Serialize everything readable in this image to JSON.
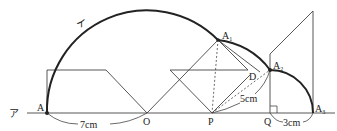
{
  "diagram": {
    "labels": {
      "line_a": "ア",
      "arc_i": "イ",
      "A": "A",
      "A1": "A",
      "A1_sub": "1",
      "A2": "A",
      "A2_sub": "2",
      "A3": "A",
      "A3_sub": "3",
      "O": "O",
      "P": "P",
      "Q": "Q",
      "D": "D"
    },
    "measurements": {
      "AO": "7cm",
      "PA2": "5cm",
      "QA3": "3cm"
    },
    "colors": {
      "stroke": "#333333",
      "arc": "#222222",
      "background": "#ffffff"
    }
  }
}
